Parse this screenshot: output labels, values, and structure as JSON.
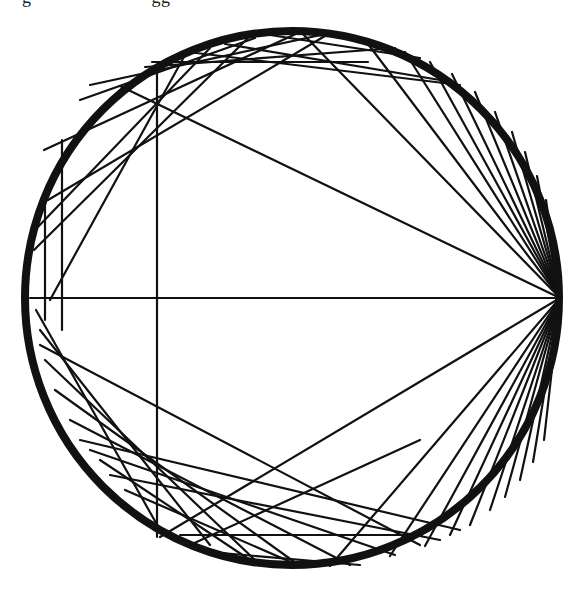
{
  "header": {
    "cut_text": "g                        gg"
  },
  "diagram": {
    "type": "chord-diagram",
    "circle": {
      "cx": 292,
      "cy": 298,
      "r": 267,
      "ring_width": 8,
      "color": "#111111"
    },
    "chord_color": "#111111",
    "chord_width": 2.2,
    "fan_origin": [
      560,
      298
    ],
    "fan_targets_upper": [
      [
        30,
        298
      ],
      [
        120,
        86
      ],
      [
        300,
        31
      ],
      [
        365,
        40
      ],
      [
        405,
        52
      ],
      [
        430,
        62
      ],
      [
        452,
        74
      ],
      [
        475,
        92
      ],
      [
        495,
        112
      ],
      [
        512,
        132
      ],
      [
        525,
        152
      ],
      [
        537,
        176
      ],
      [
        546,
        200
      ]
    ],
    "fan_targets_lower": [
      [
        160,
        537
      ],
      [
        330,
        566
      ],
      [
        390,
        556
      ],
      [
        425,
        546
      ],
      [
        450,
        535
      ],
      [
        470,
        525
      ],
      [
        490,
        510
      ],
      [
        505,
        497
      ],
      [
        520,
        480
      ],
      [
        533,
        462
      ],
      [
        544,
        440
      ]
    ],
    "chords": [
      [
        [
          157,
          66
        ],
        [
          157,
          537
        ]
      ],
      [
        [
          152,
          62
        ],
        [
          368,
          62
        ]
      ],
      [
        [
          180,
          535
        ],
        [
          422,
          535
        ]
      ],
      [
        [
          44,
          150
        ],
        [
          300,
          32
        ]
      ],
      [
        [
          34,
          250
        ],
        [
          248,
          38
        ]
      ],
      [
        [
          50,
          300
        ],
        [
          185,
          55
        ]
      ],
      [
        [
          62,
          330
        ],
        [
          62,
          140
        ]
      ],
      [
        [
          45,
          320
        ],
        [
          45,
          190
        ]
      ],
      [
        [
          80,
          100
        ],
        [
          255,
          38
        ]
      ],
      [
        [
          90,
          85
        ],
        [
          330,
          33
        ]
      ],
      [
        [
          48,
          200
        ],
        [
          330,
          33
        ]
      ],
      [
        [
          35,
          230
        ],
        [
          210,
          48
        ]
      ],
      [
        [
          145,
          67
        ],
        [
          395,
          48
        ]
      ],
      [
        [
          225,
          44
        ],
        [
          440,
          80
        ]
      ],
      [
        [
          270,
          35
        ],
        [
          420,
          58
        ]
      ],
      [
        [
          188,
          52
        ],
        [
          460,
          85
        ]
      ],
      [
        [
          36,
          310
        ],
        [
          160,
          530
        ]
      ],
      [
        [
          40,
          330
        ],
        [
          210,
          545
        ]
      ],
      [
        [
          45,
          360
        ],
        [
          255,
          560
        ]
      ],
      [
        [
          55,
          390
        ],
        [
          300,
          566
        ]
      ],
      [
        [
          70,
          420
        ],
        [
          350,
          565
        ]
      ],
      [
        [
          90,
          450
        ],
        [
          395,
          555
        ]
      ],
      [
        [
          40,
          345
        ],
        [
          420,
          545
        ]
      ],
      [
        [
          80,
          440
        ],
        [
          460,
          530
        ]
      ],
      [
        [
          110,
          475
        ],
        [
          440,
          540
        ]
      ],
      [
        [
          125,
          490
        ],
        [
          300,
          566
        ]
      ],
      [
        [
          190,
          545
        ],
        [
          420,
          440
        ]
      ],
      [
        [
          210,
          552
        ],
        [
          360,
          565
        ]
      ],
      [
        [
          100,
          460
        ],
        [
          250,
          560
        ]
      ]
    ]
  }
}
